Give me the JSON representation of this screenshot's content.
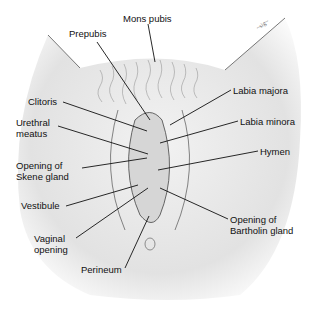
{
  "diagram": {
    "type": "anatomical-illustration",
    "labels": [
      {
        "id": "mons-pubis",
        "text": "Mons pubis",
        "x": 123,
        "y": 14
      },
      {
        "id": "prepubis",
        "text": "Prepubis",
        "x": 69,
        "y": 29
      },
      {
        "id": "labia-majora",
        "text": "Labia majora",
        "x": 233,
        "y": 86
      },
      {
        "id": "clitoris",
        "text": "Clitoris",
        "x": 28,
        "y": 97
      },
      {
        "id": "labia-minora",
        "text": "Labia minora",
        "x": 240,
        "y": 117
      },
      {
        "id": "urethral-meatus",
        "text": "Urethral\nmeatus",
        "x": 16,
        "y": 118
      },
      {
        "id": "hymen",
        "text": "Hymen",
        "x": 260,
        "y": 147
      },
      {
        "id": "opening-skene-gland",
        "text": "Opening of\nSkene gland",
        "x": 16,
        "y": 161
      },
      {
        "id": "vestibule",
        "text": "Vestibule",
        "x": 21,
        "y": 201
      },
      {
        "id": "opening-bartholin-gland",
        "text": "Opening of\nBartholin gland",
        "x": 230,
        "y": 215
      },
      {
        "id": "vaginal-opening",
        "text": "Vaginal\nopening",
        "x": 34,
        "y": 234
      },
      {
        "id": "perineum",
        "text": "Perineum",
        "x": 81,
        "y": 265
      }
    ],
    "artist_signature": "signature (illegible)"
  }
}
